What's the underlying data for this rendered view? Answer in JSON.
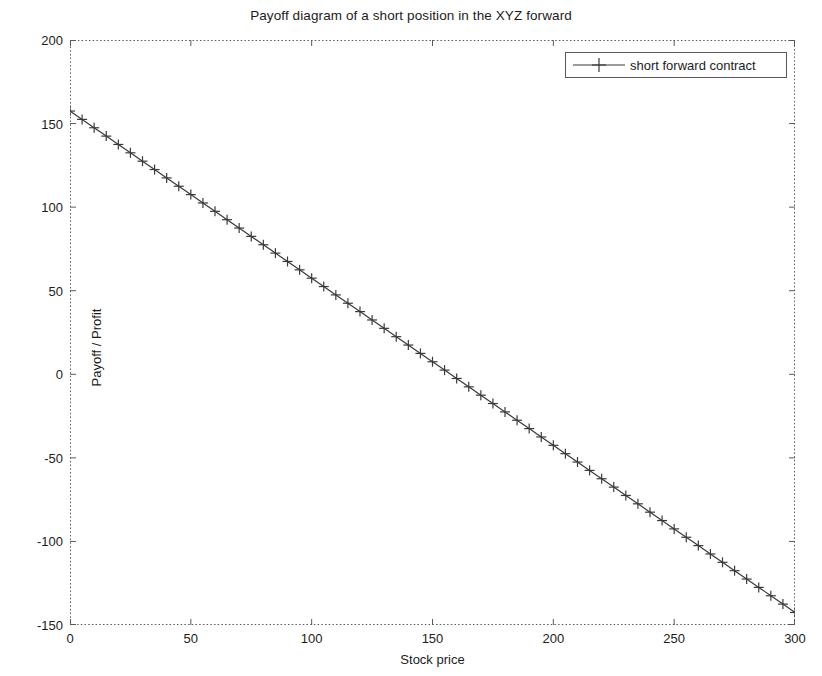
{
  "chart_data": {
    "type": "line",
    "title": "Payoff diagram of a short position in the XYZ forward",
    "xlabel": "Stock price",
    "ylabel": "Payoff / Profit",
    "xlim": [
      0,
      300
    ],
    "ylim": [
      -150,
      200
    ],
    "xticks": [
      0,
      50,
      100,
      150,
      200,
      250,
      300
    ],
    "yticks": [
      -150,
      -100,
      -50,
      0,
      50,
      100,
      150,
      200
    ],
    "xtick_labels": [
      "0",
      "50",
      "100",
      "150",
      "200",
      "250",
      "300"
    ],
    "ytick_labels": [
      "-150",
      "-100",
      "-50",
      "0",
      "50",
      "100",
      "150",
      "200"
    ],
    "grid": false,
    "legend_position": "upper right",
    "marker": "+",
    "line_color": "#3a3a3a",
    "series": [
      {
        "name": "short forward contract",
        "x": [
          0,
          5,
          10,
          15,
          20,
          25,
          30,
          35,
          40,
          45,
          50,
          55,
          60,
          65,
          70,
          75,
          80,
          85,
          90,
          95,
          100,
          105,
          110,
          115,
          120,
          125,
          130,
          135,
          140,
          145,
          150,
          155,
          160,
          165,
          170,
          175,
          180,
          185,
          190,
          195,
          200,
          205,
          210,
          215,
          220,
          225,
          230,
          235,
          240,
          245,
          250,
          255,
          260,
          265,
          270,
          275,
          280,
          285,
          290,
          295,
          300
        ],
        "values": [
          157.5,
          152.5,
          147.5,
          142.5,
          137.5,
          132.5,
          127.5,
          122.5,
          117.5,
          112.5,
          107.5,
          102.5,
          97.5,
          92.5,
          87.5,
          82.5,
          77.5,
          72.5,
          67.5,
          62.5,
          57.5,
          52.5,
          47.5,
          42.5,
          37.5,
          32.5,
          27.5,
          22.5,
          17.5,
          12.5,
          7.5,
          2.5,
          -2.5,
          -7.5,
          -12.5,
          -17.5,
          -22.5,
          -27.5,
          -32.5,
          -37.5,
          -42.5,
          -47.5,
          -52.5,
          -57.5,
          -62.5,
          -67.5,
          -72.5,
          -77.5,
          -82.5,
          -87.5,
          -92.5,
          -97.5,
          -102.5,
          -107.5,
          -112.5,
          -117.5,
          -122.5,
          -127.5,
          -132.5,
          -137.5,
          -142.5
        ]
      }
    ]
  },
  "legend": {
    "entries": [
      {
        "label": "short forward contract"
      }
    ]
  },
  "axes": {
    "frame_color": "#555555",
    "tick_color": "#555555",
    "background": "#ffffff"
  }
}
